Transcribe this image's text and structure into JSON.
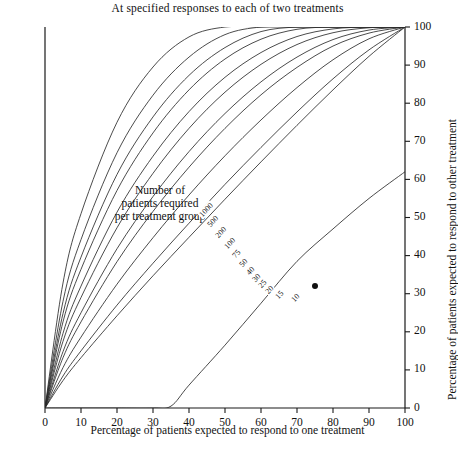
{
  "title": "At specified responses to each of two treatments",
  "annotation": {
    "line1": "Number of",
    "line2": "patients required",
    "line3": "per treatment group"
  },
  "axes": {
    "x_title": "Percentage of patients expected to respond to one treatment",
    "y_title": "Percentage of patients expected to respond to other treatment",
    "x_ticks": [
      "0",
      "10",
      "20",
      "30",
      "40",
      "50",
      "60",
      "70",
      "80",
      "90",
      "100"
    ],
    "y_ticks": [
      "0",
      "10",
      "20",
      "30",
      "40",
      "50",
      "60",
      "70",
      "80",
      "90",
      "100"
    ],
    "corner_label": "0"
  },
  "chart_data": {
    "type": "line",
    "title": "At specified responses to each of two treatments",
    "xlabel": "Percentage of patients expected to respond to one treatment",
    "ylabel": "Percentage of patients expected to respond to other treatment",
    "xlim": [
      0,
      100
    ],
    "ylim": [
      0,
      100
    ],
    "xticks": [
      0,
      10,
      20,
      30,
      40,
      50,
      60,
      70,
      80,
      90,
      100
    ],
    "yticks": [
      0,
      10,
      20,
      30,
      40,
      50,
      60,
      70,
      80,
      90,
      100
    ],
    "grid": false,
    "legend": "inline-curve-labels",
    "curve_label_heading": "Number of patients required per treatment group",
    "marker_point": {
      "x": 75,
      "y": 32
    },
    "series": [
      {
        "name": "1000",
        "x": [
          0,
          5,
          10,
          20,
          30,
          40,
          50,
          60,
          70,
          80,
          90,
          100
        ],
        "values": [
          0,
          7.2,
          13.2,
          24.2,
          34.7,
          44.8,
          54.8,
          64.6,
          74.2,
          83.5,
          92.3,
          100
        ]
      },
      {
        "name": "500",
        "x": [
          0,
          5,
          10,
          20,
          30,
          40,
          50,
          60,
          70,
          80,
          90,
          100
        ],
        "values": [
          0,
          8.4,
          15.0,
          27.0,
          38.0,
          48.5,
          58.7,
          68.4,
          77.7,
          86.4,
          94.0,
          100
        ]
      },
      {
        "name": "200",
        "x": [
          0,
          5,
          10,
          20,
          30,
          40,
          50,
          60,
          70,
          80,
          90,
          100
        ],
        "values": [
          0,
          10.6,
          18.6,
          32.5,
          44.7,
          55.9,
          66.2,
          75.6,
          84.1,
          91.4,
          96.9,
          100
        ]
      },
      {
        "name": "100",
        "x": [
          0,
          5,
          10,
          20,
          30,
          40,
          50,
          60,
          70,
          80,
          90,
          100
        ],
        "values": [
          0,
          13.2,
          22.6,
          38.4,
          51.6,
          63.2,
          73.4,
          82.2,
          89.4,
          95.0,
          98.4,
          100
        ]
      },
      {
        "name": "75",
        "x": [
          0,
          5,
          10,
          20,
          30,
          40,
          50,
          60,
          70,
          80,
          90,
          100
        ],
        "values": [
          0,
          14.8,
          25.0,
          41.8,
          55.5,
          67.3,
          77.3,
          85.6,
          92.1,
          96.7,
          99.2,
          100
        ]
      },
      {
        "name": "50",
        "x": [
          0,
          5,
          10,
          20,
          30,
          40,
          50,
          60,
          70,
          80,
          90,
          100
        ],
        "values": [
          0,
          17.5,
          29.0,
          47.3,
          61.6,
          73.4,
          82.9,
          90.2,
          95.4,
          98.5,
          99.8,
          100
        ]
      },
      {
        "name": "40",
        "x": [
          0,
          5,
          10,
          20,
          30,
          40,
          50,
          60,
          70,
          80,
          90,
          100
        ],
        "values": [
          0,
          19.6,
          32.0,
          51.4,
          66.1,
          77.8,
          86.8,
          93.3,
          97.5,
          99.5,
          100,
          100
        ]
      },
      {
        "name": "30",
        "x": [
          0,
          5,
          10,
          20,
          30,
          40,
          50,
          60,
          70,
          80,
          90,
          100
        ],
        "values": [
          0,
          22.6,
          36.4,
          57.1,
          72.2,
          83.5,
          91.6,
          96.8,
          99.4,
          100,
          100,
          100
        ]
      },
      {
        "name": "25",
        "x": [
          0,
          5,
          10,
          20,
          30,
          40,
          50,
          60,
          70,
          80,
          90,
          100
        ],
        "values": [
          0,
          24.8,
          39.6,
          61.3,
          76.4,
          87.3,
          94.6,
          98.8,
          100,
          100,
          100,
          100
        ]
      },
      {
        "name": "20",
        "x": [
          0,
          5,
          10,
          20,
          30,
          40,
          50,
          60,
          70,
          80,
          90,
          100
        ],
        "values": [
          0,
          28.0,
          44.2,
          67.0,
          82.1,
          92.1,
          98.0,
          100,
          100,
          100,
          100,
          100
        ]
      },
      {
        "name": "15",
        "x": [
          0,
          5,
          10,
          20,
          30,
          40,
          50,
          60,
          70,
          80,
          90,
          100
        ],
        "values": [
          0,
          32.8,
          51.0,
          75.0,
          89.5,
          97.4,
          100,
          100,
          100,
          100,
          100,
          100
        ]
      },
      {
        "name": "10",
        "x": [
          0,
          10,
          20,
          30,
          35,
          40,
          50,
          60,
          70,
          80,
          90,
          100
        ],
        "values": [
          0,
          0,
          0,
          0,
          0.5,
          6.0,
          16.5,
          27.5,
          38.5,
          47.0,
          55.0,
          62.0
        ]
      }
    ],
    "curve_labels": [
      {
        "name": "1000",
        "x": 200,
        "y": 212
      },
      {
        "name": "500",
        "x": 208,
        "y": 222
      },
      {
        "name": "200",
        "x": 216,
        "y": 233
      },
      {
        "name": "100",
        "x": 225,
        "y": 244
      },
      {
        "name": "75",
        "x": 233,
        "y": 253
      },
      {
        "name": "50",
        "x": 240,
        "y": 262
      },
      {
        "name": "40",
        "x": 247,
        "y": 270
      },
      {
        "name": "30",
        "x": 253,
        "y": 277
      },
      {
        "name": "25",
        "x": 259,
        "y": 283
      },
      {
        "name": "20",
        "x": 266,
        "y": 289
      },
      {
        "name": "15",
        "x": 276,
        "y": 294
      },
      {
        "name": "10",
        "x": 292,
        "y": 297
      }
    ]
  },
  "colors": {
    "axis": "#1a1a1a",
    "curve": "#2b2b2b",
    "text": "#111111"
  }
}
